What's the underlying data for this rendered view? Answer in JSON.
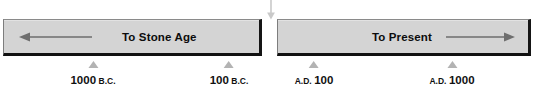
{
  "figure": {
    "type": "timeline",
    "gap_arrow": {
      "icon": "arrow-down-icon",
      "direction": "down",
      "color": "#c9c9c9"
    },
    "bars": [
      {
        "id": "bar-left",
        "label": "To Stone Age",
        "arrow_icon": "arrow-left-icon",
        "arrow_direction": "left",
        "fill_color": "#d4d4d4"
      },
      {
        "id": "bar-right",
        "label": "To Present",
        "arrow_icon": "arrow-right-icon",
        "arrow_direction": "right",
        "fill_color": "#d4d4d4"
      }
    ],
    "ticks": [
      {
        "id": "tick-1000-bc",
        "marker_icon": "triangle-up-icon",
        "number": "1000",
        "era": "B.C.",
        "era_position": "after",
        "x": 93
      },
      {
        "id": "tick-100-bc",
        "marker_icon": "triangle-up-icon",
        "number": "100",
        "era": "B.C.",
        "era_position": "after",
        "x": 229
      },
      {
        "id": "tick-ad-100",
        "marker_icon": "triangle-up-icon",
        "number": "100",
        "era": "A.D.",
        "era_position": "before",
        "x": 314
      },
      {
        "id": "tick-ad-1000",
        "marker_icon": "triangle-up-icon",
        "number": "1000",
        "era": "A.D.",
        "era_position": "before",
        "x": 452
      }
    ]
  }
}
